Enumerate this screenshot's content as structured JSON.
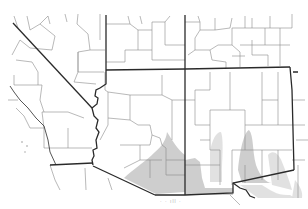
{
  "map": {
    "region": "Southwestern United States",
    "style": "grayscale county outline map",
    "states_shown": [
      "California",
      "Nevada",
      "Utah",
      "Colorado",
      "Arizona",
      "New Mexico",
      "Texas"
    ],
    "layers": {
      "state_borders": "dark line",
      "county_borders": "thin gray line",
      "distribution_range": "gray shaded areas"
    },
    "colors": {
      "background": "#ffffff",
      "state_border": "#2a2a2a",
      "county_border": "#8a8a8a",
      "range_fill": "#c9c9c9",
      "range_fill_light": "#dcdcdc"
    },
    "shaded_range_description": "Southeastern Arizona, southwestern and south-central New Mexico, extending toward west Texas",
    "caption": "· · ıll ·"
  }
}
